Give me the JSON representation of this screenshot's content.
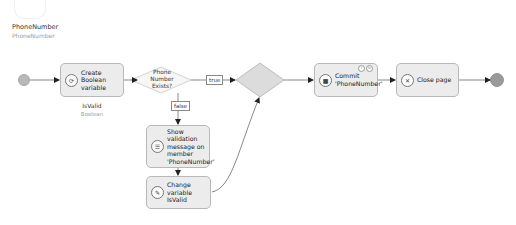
{
  "parameter": {
    "name": "PhoneNumber",
    "type": "PhoneNumber",
    "icon": "parameter-icon"
  },
  "nodes": {
    "start": {
      "icon": "start-event-icon"
    },
    "create_var": {
      "label": "Create Boolean variable",
      "icon": "create-variable-icon",
      "output_name": "IsValid",
      "output_type": "Boolean"
    },
    "decision": {
      "label": "Phone Number Exists?",
      "icon": "decision-icon"
    },
    "merge": {
      "icon": "merge-icon"
    },
    "validation": {
      "label": "Show validation message on member 'PhoneNumber'",
      "icon": "validation-feedback-icon"
    },
    "change_var": {
      "label": "Change variable IsValid",
      "icon": "change-variable-icon"
    },
    "commit": {
      "label": "Commit 'PhoneNumber'",
      "icon": "commit-icon",
      "badges": [
        "error-handler-icon",
        "refresh-icon"
      ]
    },
    "close_page": {
      "label": "Close page",
      "icon": "close-page-icon"
    },
    "end": {
      "icon": "end-event-icon"
    }
  },
  "flow_labels": {
    "true": "true",
    "false": "false"
  },
  "colors": {
    "node_fill": "#ececec",
    "node_border": "#b8b8b8",
    "event_fill": "#b0b0b0",
    "line": "#555555"
  }
}
